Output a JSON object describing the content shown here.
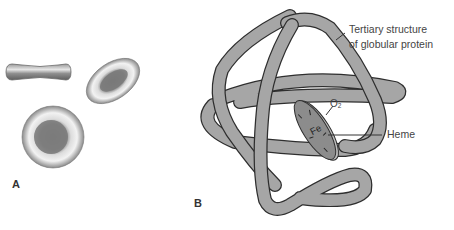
{
  "panels": {
    "a": {
      "label": "A"
    },
    "b": {
      "label": "B"
    }
  },
  "labels": {
    "tertiary_line1": "Tertiary structure",
    "tertiary_line2": "of globular protein",
    "oxygen": "O",
    "oxygen_sub": "2",
    "iron": "Fe",
    "heme": "Heme"
  },
  "colors": {
    "protein_fill": "#a6a6a6",
    "outline": "#2e2e2e",
    "heme_fill": "#8c8c8c",
    "cell_light": "#e4e4e4",
    "cell_dark": "#7a7a7a",
    "text": "#444444"
  }
}
